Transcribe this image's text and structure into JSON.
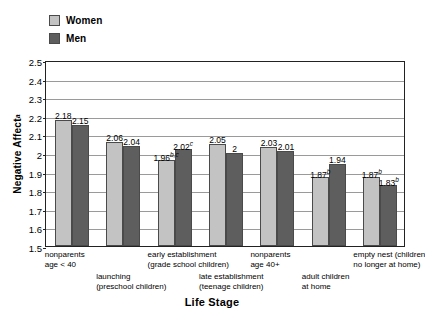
{
  "legend": {
    "items": [
      {
        "label": "Women",
        "color": "#c3c3c3",
        "key": "women"
      },
      {
        "label": "Men",
        "color": "#5e5e5e",
        "key": "men"
      }
    ]
  },
  "axis": {
    "y_title": "Negative Affect",
    "y_title_sup": "a",
    "x_title": "Life Stage"
  },
  "chart_data": {
    "type": "bar",
    "title": "",
    "xlabel": "Life Stage",
    "ylabel": "Negative Affect",
    "ylim": [
      1.5,
      2.5
    ],
    "ytick_labels": [
      "2.5",
      "2.4",
      "2.3",
      "2.2",
      "2.1",
      "2",
      "1.9",
      "1.8",
      "1.7",
      "1.6",
      "1.5"
    ],
    "ytick_values": [
      2.5,
      2.4,
      2.3,
      2.2,
      2.1,
      2.0,
      1.9,
      1.8,
      1.7,
      1.6,
      1.5
    ],
    "grid": true,
    "legend_position": "top-left",
    "categories": [
      "nonparents\nage < 40",
      "launching\n(preschool children)",
      "early establishment\n(grade school children)",
      "late establishment\n(teenage children)",
      "nonparents\nage 40+",
      "adult children\nat home",
      "empty nest (children\nno longer at home)"
    ],
    "category_lines": [
      [
        "nonparents",
        "age < 40"
      ],
      [
        "launching",
        "(preschool children)"
      ],
      [
        "early establishment",
        "(grade school children)"
      ],
      [
        "late establishment",
        "(teenage children)"
      ],
      [
        "nonparents",
        "age 40+"
      ],
      [
        "adult children",
        "at home"
      ],
      [
        "empty nest (children",
        "no longer at home)"
      ]
    ],
    "category_label_row": [
      0,
      1,
      0,
      1,
      0,
      1,
      0
    ],
    "series": [
      {
        "name": "Women",
        "color": "#c3c3c3",
        "values": [
          2.18,
          2.06,
          1.96,
          2.05,
          2.03,
          1.87,
          1.87
        ],
        "labels": [
          "2.18",
          "2.06",
          "1.96",
          "2.05",
          "2.03",
          "1.87",
          "1.87"
        ],
        "label_sups": [
          "",
          "",
          "b,c",
          "",
          "",
          "b",
          "b"
        ]
      },
      {
        "name": "Men",
        "color": "#5e5e5e",
        "values": [
          2.15,
          2.04,
          2.02,
          2.0,
          2.01,
          1.94,
          1.83
        ],
        "labels": [
          "2.15",
          "2.04",
          "2.02",
          "2",
          "2.01",
          "1.94",
          "1.83"
        ],
        "label_sups": [
          "",
          "",
          "c",
          "",
          "",
          "",
          "b"
        ]
      }
    ]
  }
}
